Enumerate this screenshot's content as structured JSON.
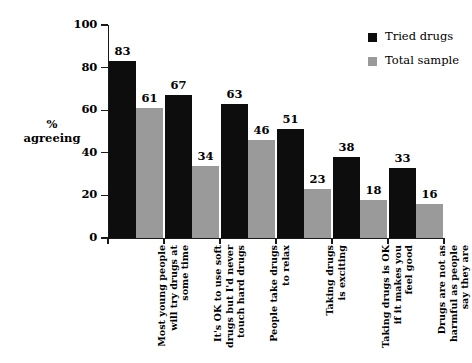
{
  "chart_data": {
    "type": "bar",
    "title": "",
    "subtitle": "",
    "xlabel": "",
    "ylabel": "% agreeing",
    "ylabel_lines": [
      "%",
      "agreeing"
    ],
    "ylim": [
      0,
      100
    ],
    "yticks": [
      0,
      20,
      40,
      60,
      80,
      100
    ],
    "ytick_labels": [
      "0",
      "20",
      "40",
      "60",
      "80",
      "100"
    ],
    "grid": false,
    "legend_position": "top-right",
    "categories": [
      "Most young people will try drugs at some time",
      "It's OK to use soft drugs but I'd never touch hard drugs",
      "People take drugs to relax",
      "Taking drugs is exciting",
      "Taking drugs is OK if it makes you feel good",
      "Drugs are not as harmful as people say they are"
    ],
    "category_lines": [
      [
        "Most young people",
        "will try drugs at",
        "some time"
      ],
      [
        "It's OK to use soft",
        "drugs but I'd never",
        "touch hard drugs"
      ],
      [
        "People take drugs",
        "to relax"
      ],
      [
        "Taking drugs",
        "is exciting"
      ],
      [
        "Taking drugs is OK",
        "if it makes you",
        "feel good"
      ],
      [
        "Drugs are not as",
        "harmful as people",
        "say they are"
      ]
    ],
    "series": [
      {
        "name": "Tried drugs",
        "color": "#0d0d0d",
        "values": [
          83,
          67,
          63,
          51,
          38,
          33
        ]
      },
      {
        "name": "Total sample",
        "color": "#9a9a9a",
        "values": [
          61,
          34,
          46,
          23,
          18,
          16
        ]
      }
    ]
  },
  "legend": {
    "items": [
      {
        "label": "Tried drugs",
        "swatch": "black"
      },
      {
        "label": "Total sample",
        "swatch": "gray"
      }
    ]
  }
}
